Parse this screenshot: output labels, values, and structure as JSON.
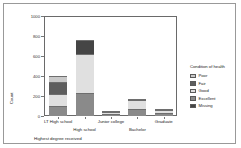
{
  "chart_data": {
    "type": "bar",
    "subtype": "stacked",
    "title": "",
    "xlabel": "Highest degree received",
    "ylabel": "Count",
    "categories": [
      "LT High school",
      "High school",
      "Junior college",
      "Bachelor",
      "Graduate"
    ],
    "ylim": [
      0,
      1000
    ],
    "yticks": [
      0,
      200,
      400,
      600,
      800,
      1000
    ],
    "ytick_labels": [
      "0",
      "200",
      "400",
      "600",
      "800",
      "1000"
    ],
    "grid": false,
    "legend": {
      "title": "Condition of health",
      "position": "right",
      "entries": [
        "Poor",
        "Fair",
        "Good",
        "Excellent",
        "Missing"
      ]
    },
    "series": [
      {
        "name": "Excellent",
        "color": "#8a8a8a",
        "values": [
          105,
          230,
          20,
          75,
          30
        ]
      },
      {
        "name": "Good",
        "color": "#e0e0e0",
        "values": [
          120,
          395,
          22,
          82,
          33
        ]
      },
      {
        "name": "Fair",
        "color": "#5e5e5e",
        "values": [
          120,
          0,
          0,
          0,
          0
        ]
      },
      {
        "name": "Poor",
        "color": "#c9c9c9",
        "values": [
          55,
          0,
          0,
          0,
          0
        ]
      },
      {
        "name": "Missing",
        "color": "#454545",
        "values": [
          0,
          135,
          3,
          15,
          4
        ]
      }
    ],
    "totals": [
      400,
      760,
      45,
      172,
      67
    ]
  },
  "colors": {
    "poor": "#c9c9c9",
    "fair": "#5e5e5e",
    "good": "#e0e0e0",
    "excellent": "#8a8a8a",
    "missing": "#454545",
    "axis": "#777777",
    "border": "#999999"
  }
}
